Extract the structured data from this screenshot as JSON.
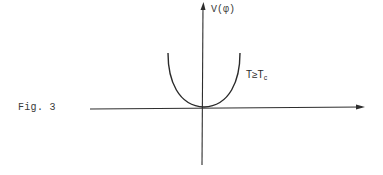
{
  "figure": {
    "caption": "Fig. 3",
    "y_axis_label": "V(φ)",
    "y_axis_label_display": "V(φ)",
    "curve_label_main": "T≥T",
    "curve_label_sub": "c",
    "curve_label_full": "T≥Tc",
    "colors": {
      "ink": "#2a2a2a",
      "background": "#ffffff"
    }
  },
  "diagram": {
    "type": "potential-curve",
    "axes": {
      "x": {
        "label": "",
        "arrow": "right"
      },
      "y": {
        "label": "V(φ)",
        "arrow": "up"
      }
    },
    "curves": [
      {
        "name": "T≥Tc",
        "shape": "parabola",
        "minimum_at": [
          0,
          0
        ]
      }
    ]
  }
}
